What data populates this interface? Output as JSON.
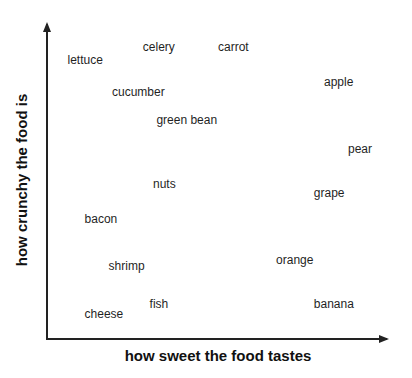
{
  "chart_data": {
    "type": "scatter",
    "title": "",
    "xlabel": "how sweet the food tastes",
    "ylabel": "how crunchy the food is",
    "xlim": [
      0,
      10
    ],
    "ylim": [
      0,
      10
    ],
    "grid": false,
    "legend": null,
    "ticks": "none",
    "points": [
      {
        "label": "lettuce",
        "x": 0.6,
        "y": 8.8
      },
      {
        "label": "celery",
        "x": 2.8,
        "y": 9.2
      },
      {
        "label": "carrot",
        "x": 5.0,
        "y": 9.2
      },
      {
        "label": "cucumber",
        "x": 1.9,
        "y": 7.8
      },
      {
        "label": "green bean",
        "x": 3.2,
        "y": 6.9
      },
      {
        "label": "apple",
        "x": 8.1,
        "y": 8.1
      },
      {
        "label": "pear",
        "x": 8.8,
        "y": 6.0
      },
      {
        "label": "nuts",
        "x": 3.1,
        "y": 4.9
      },
      {
        "label": "grape",
        "x": 7.8,
        "y": 4.6
      },
      {
        "label": "bacon",
        "x": 1.1,
        "y": 3.8
      },
      {
        "label": "shrimp",
        "x": 1.8,
        "y": 2.3
      },
      {
        "label": "orange",
        "x": 6.7,
        "y": 2.5
      },
      {
        "label": "fish",
        "x": 3.0,
        "y": 1.1
      },
      {
        "label": "cheese",
        "x": 1.1,
        "y": 0.8
      },
      {
        "label": "banana",
        "x": 7.8,
        "y": 1.1
      }
    ]
  },
  "layout": {
    "plot_left_px": 47,
    "plot_right_px": 389,
    "plot_top_px": 22,
    "plot_bottom_px": 339,
    "axis_color": "#222222",
    "label_color": "#1f1f1f"
  }
}
